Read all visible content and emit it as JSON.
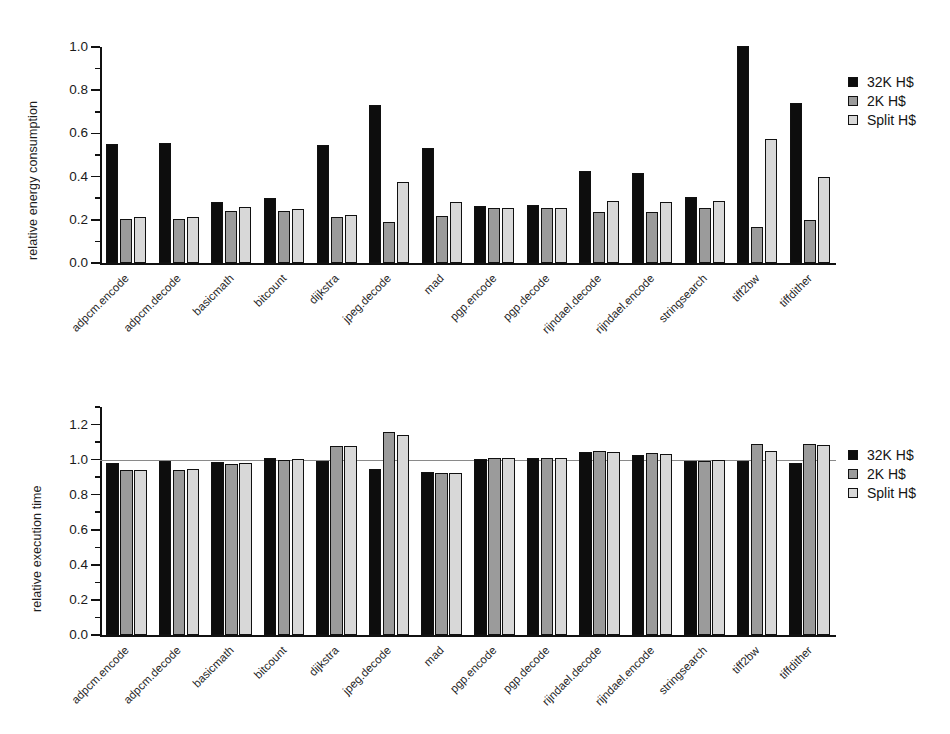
{
  "chart_data": [
    {
      "id": "energy",
      "type": "bar",
      "title": "",
      "xlabel": "",
      "ylabel": "relative energy consumption",
      "ylim": [
        0.0,
        1.0
      ],
      "ytick_labels": [
        "0.0",
        "0.2",
        "0.4",
        "0.6",
        "0.8",
        "1.0"
      ],
      "yticks": [
        0.0,
        0.2,
        0.4,
        0.6,
        0.8,
        1.0
      ],
      "minor_ticks": [
        0.1,
        0.3,
        0.5,
        0.7,
        0.9
      ],
      "grid": false,
      "legend_position": "right",
      "categories": [
        "adpcm.encode",
        "adpcm.decode",
        "basicmath",
        "bitcount",
        "dijkstra",
        "jpeg.decode",
        "mad",
        "pgp.encode",
        "pgp.decode",
        "rijndael.decode",
        "rijndael.encode",
        "stringsearch",
        "tiff2bw",
        "tiffdither"
      ],
      "series": [
        {
          "name": "32K H$",
          "color": "#0d0d0d",
          "values": [
            0.55,
            0.555,
            0.283,
            0.303,
            0.547,
            0.732,
            0.534,
            0.266,
            0.268,
            0.424,
            0.415,
            0.305,
            1.005,
            0.74
          ]
        },
        {
          "name": "2K H$",
          "color": "#9b9b9b",
          "values": [
            0.203,
            0.206,
            0.243,
            0.243,
            0.212,
            0.188,
            0.219,
            0.253,
            0.253,
            0.236,
            0.236,
            0.253,
            0.165,
            0.199
          ]
        },
        {
          "name": "Split H$",
          "color": "#d8d8d8",
          "values": [
            0.215,
            0.212,
            0.258,
            0.25,
            0.222,
            0.377,
            0.284,
            0.256,
            0.256,
            0.285,
            0.283,
            0.285,
            0.575,
            0.396
          ]
        }
      ]
    },
    {
      "id": "time",
      "type": "bar",
      "title": "",
      "xlabel": "",
      "ylabel": "relative execution time",
      "ylim": [
        0.0,
        1.3
      ],
      "ytick_labels": [
        "0.0",
        "0.2",
        "0.4",
        "0.6",
        "0.8",
        "1.0",
        "1.2"
      ],
      "yticks": [
        0.0,
        0.2,
        0.4,
        0.6,
        0.8,
        1.0,
        1.2
      ],
      "minor_ticks": [
        0.1,
        0.3,
        0.5,
        0.7,
        0.9,
        1.1,
        1.3
      ],
      "reference_line": 1.0,
      "grid": false,
      "legend_position": "right",
      "categories": [
        "adpcm.encode",
        "adpcm.decode",
        "basicmath",
        "bitcount",
        "dijkstra",
        "jpeg.decode",
        "mad",
        "pgp.encode",
        "pgp.decode",
        "rijndael.decode",
        "rijndael.encode",
        "stringsearch",
        "tiff2bw",
        "tiffdither"
      ],
      "series": [
        {
          "name": "32K H$",
          "color": "#0d0d0d",
          "values": [
            0.978,
            0.995,
            0.985,
            1.008,
            0.99,
            0.948,
            0.932,
            1.005,
            1.008,
            1.042,
            1.028,
            0.995,
            0.995,
            0.982
          ]
        },
        {
          "name": "2K H$",
          "color": "#9b9b9b",
          "values": [
            0.94,
            0.942,
            0.975,
            1.0,
            1.08,
            1.155,
            0.925,
            1.012,
            1.012,
            1.048,
            1.038,
            0.995,
            1.09,
            1.09
          ]
        },
        {
          "name": "Split H$",
          "color": "#d8d8d8",
          "values": [
            0.94,
            0.945,
            0.978,
            1.005,
            1.078,
            1.142,
            0.925,
            1.008,
            1.008,
            1.042,
            1.03,
            0.998,
            1.048,
            1.085
          ]
        }
      ]
    }
  ],
  "charts": {
    "energy": {
      "ylabel": "relative energy consumption",
      "legend": [
        {
          "label": "32K H$"
        },
        {
          "label": "2K H$"
        },
        {
          "label": "Split H$"
        }
      ]
    },
    "time": {
      "ylabel": "relative execution time",
      "legend": [
        {
          "label": "32K H$"
        },
        {
          "label": "2K H$"
        },
        {
          "label": "Split H$"
        }
      ]
    }
  }
}
